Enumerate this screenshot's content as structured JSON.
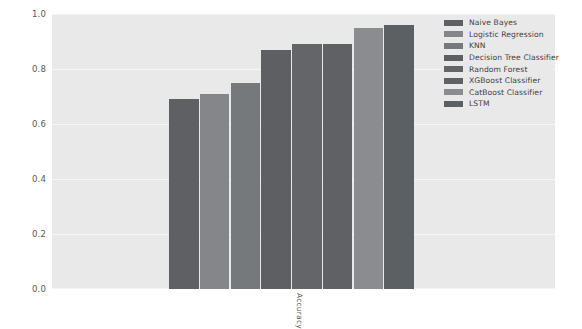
{
  "chart_data": {
    "type": "bar",
    "title": "",
    "xlabel": "",
    "ylabel": "",
    "categories": [
      "Accuracy"
    ],
    "xtick_labels": [
      "Accuracy"
    ],
    "ylim": [
      0.0,
      1.0
    ],
    "ytick_labels": [
      "0.0",
      "0.2",
      "0.4",
      "0.6",
      "0.8",
      "1.0"
    ],
    "ytick_values": [
      0.0,
      0.2,
      0.4,
      0.6,
      0.8,
      1.0
    ],
    "grid": true,
    "legend_position": "upper right",
    "series": [
      {
        "name": "Naive Bayes",
        "values": [
          0.69
        ],
        "color": "#5f6063"
      },
      {
        "name": "Logistic Regression",
        "values": [
          0.71
        ],
        "color": "#848689"
      },
      {
        "name": "KNN",
        "values": [
          0.75
        ],
        "color": "#76797c"
      },
      {
        "name": "Decision Tree Classifier",
        "values": [
          0.87
        ],
        "color": "#5d5f62"
      },
      {
        "name": "Random Forest",
        "values": [
          0.89
        ],
        "color": "#636568"
      },
      {
        "name": "XGBoost Classifier",
        "values": [
          0.89
        ],
        "color": "#5f6164"
      },
      {
        "name": "CatBoost Classifier",
        "values": [
          0.95
        ],
        "color": "#8a8c8f"
      },
      {
        "name": "LSTM",
        "values": [
          0.96
        ],
        "color": "#5d6063"
      }
    ],
    "legend_entries": [
      "Naive Bayes",
      "Logistic Regression",
      "KNN",
      "Decision Tree Classifier",
      "Random Forest",
      "XGBoost Classifier",
      "CatBoost Classifier",
      "LSTM"
    ],
    "colors": {
      "plot_background": "#e9e9e9",
      "figure_background": "#ffffff",
      "gridline": "#f6f6f6",
      "tick_text": "#58595b"
    }
  }
}
